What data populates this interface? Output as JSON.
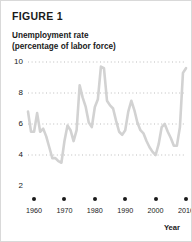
{
  "figure": {
    "title": "FIGURE 1",
    "y_axis_title_line1": "Unemployment rate",
    "y_axis_title_line2": "(percentage of labor force)",
    "x_axis_title": "Year"
  },
  "colors": {
    "line": "#d2d2d2",
    "grid": "#bdbdbd",
    "text": "#1a1a1a",
    "border": "#d9d9d9",
    "background": "#ffffff"
  },
  "chart_data": {
    "type": "line",
    "title": "FIGURE 1",
    "subtitle": "Unemployment rate (percentage of labor force)",
    "xlabel": "Year",
    "ylabel": "Unemployment rate (percentage of labor force)",
    "xlim": [
      1958,
      2010
    ],
    "ylim": [
      2,
      10
    ],
    "yticks": [
      2,
      4,
      6,
      8,
      10
    ],
    "ytick_labels": [
      "2",
      "4",
      "6",
      "8",
      "10"
    ],
    "xticks": [
      1960,
      1970,
      1980,
      1990,
      2000,
      2010
    ],
    "xtick_labels": [
      "1960",
      "1970",
      "1980",
      "1990",
      "2000",
      "2010"
    ],
    "grid": "horizontal-dotted",
    "legend": "none",
    "series": [
      {
        "name": "Unemployment rate",
        "x": [
          1958,
          1959,
          1960,
          1961,
          1962,
          1963,
          1964,
          1965,
          1966,
          1967,
          1968,
          1969,
          1970,
          1971,
          1972,
          1973,
          1974,
          1975,
          1976,
          1977,
          1978,
          1979,
          1980,
          1981,
          1982,
          1983,
          1984,
          1985,
          1986,
          1987,
          1988,
          1989,
          1990,
          1991,
          1992,
          1993,
          1994,
          1995,
          1996,
          1997,
          1998,
          1999,
          2000,
          2001,
          2002,
          2003,
          2004,
          2005,
          2006,
          2007,
          2008,
          2009,
          2010
        ],
        "values": [
          6.8,
          5.5,
          5.5,
          6.7,
          5.5,
          5.7,
          5.2,
          4.5,
          3.8,
          3.8,
          3.6,
          3.5,
          4.9,
          5.9,
          5.6,
          4.9,
          5.6,
          8.5,
          7.7,
          7.1,
          6.1,
          5.8,
          7.1,
          7.6,
          9.7,
          9.6,
          7.5,
          7.2,
          7.0,
          6.2,
          5.5,
          5.3,
          5.6,
          6.8,
          7.5,
          6.9,
          6.1,
          5.6,
          5.4,
          4.9,
          4.5,
          4.2,
          4.0,
          4.7,
          5.8,
          6.0,
          5.5,
          5.1,
          4.6,
          4.6,
          5.8,
          9.3,
          9.6
        ]
      }
    ]
  }
}
